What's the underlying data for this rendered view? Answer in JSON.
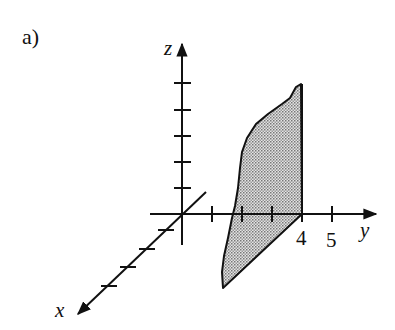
{
  "figure": {
    "panel_label": "a)",
    "axes": {
      "x": {
        "label": "x",
        "ticks": 4
      },
      "y": {
        "label": "y",
        "tick_labels": [
          "4",
          "5"
        ],
        "ticks": 5
      },
      "z": {
        "label": "z",
        "ticks": 5
      }
    },
    "region": {
      "description": "Shaded planar region bounded by a curve, the vertical line y=4, and a slanted line in the xy-plane",
      "fill": "stippled gray",
      "fill_color": "#c8c8c8",
      "stroke_color": "#111111"
    }
  }
}
